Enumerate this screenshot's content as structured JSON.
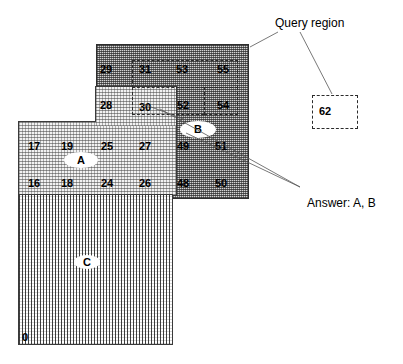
{
  "diagram": {
    "title_annotations": {
      "query_region_label": "Query region",
      "answer_label": "Answer: A, B"
    },
    "isolated_cell": {
      "value": "62",
      "style": "dashed-box"
    },
    "regions": [
      {
        "id": "A",
        "label": "A",
        "fill": "light-stipple",
        "color": "#f2f2f2"
      },
      {
        "id": "B",
        "label": "B",
        "fill": "dark-stipple",
        "color": "#d4d4d4"
      },
      {
        "id": "C",
        "label": "C",
        "fill": "vertical-hatch",
        "color": "#ffffff"
      }
    ],
    "cell_numbers": [
      {
        "value": "29",
        "x": 100,
        "y": 64,
        "region": "B"
      },
      {
        "value": "31",
        "x": 139,
        "y": 64,
        "region": "B"
      },
      {
        "value": "53",
        "x": 176,
        "y": 64,
        "region": "B"
      },
      {
        "value": "55",
        "x": 217,
        "y": 64,
        "region": "B"
      },
      {
        "value": "28",
        "x": 100,
        "y": 100,
        "region": "B"
      },
      {
        "value": "30",
        "x": 139,
        "y": 102,
        "region": "A"
      },
      {
        "value": "52",
        "x": 177,
        "y": 100,
        "region": "B"
      },
      {
        "value": "54",
        "x": 217,
        "y": 100,
        "region": "B"
      },
      {
        "value": "17",
        "x": 28,
        "y": 141,
        "region": "A"
      },
      {
        "value": "19",
        "x": 61,
        "y": 141,
        "region": "A"
      },
      {
        "value": "25",
        "x": 101,
        "y": 141,
        "region": "A"
      },
      {
        "value": "27",
        "x": 139,
        "y": 141,
        "region": "A"
      },
      {
        "value": "49",
        "x": 177,
        "y": 141,
        "region": "B"
      },
      {
        "value": "51",
        "x": 215,
        "y": 141,
        "region": "B"
      },
      {
        "value": "16",
        "x": 28,
        "y": 178,
        "region": "A"
      },
      {
        "value": "18",
        "x": 61,
        "y": 178,
        "region": "A"
      },
      {
        "value": "24",
        "x": 101,
        "y": 178,
        "region": "A"
      },
      {
        "value": "26",
        "x": 139,
        "y": 178,
        "region": "A"
      },
      {
        "value": "48",
        "x": 177,
        "y": 178,
        "region": "B"
      },
      {
        "value": "50",
        "x": 215,
        "y": 178,
        "region": "B"
      },
      {
        "value": "0",
        "x": 22,
        "y": 333,
        "region": "C"
      }
    ]
  }
}
